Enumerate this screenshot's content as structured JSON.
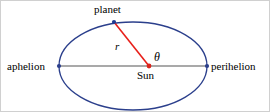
{
  "figure": {
    "labels": {
      "aphelion": "aphelion",
      "perihelion": "perihelion",
      "planet": "planet",
      "sun": "Sun",
      "radius": "r",
      "angle": "θ"
    },
    "colors": {
      "orbit_ellipse": "#2b3f8c",
      "major_axis": "#8c8c8c",
      "radius_line": "#e8201a",
      "sun_marker": "#d9251d",
      "planet_marker": "#1f3a93",
      "vertex_marker": "#2b3f8c",
      "label_text": "#000000",
      "background": "#ffffff",
      "frame_border": "#d0d0d0"
    },
    "geometry": {
      "ellipse_center_x": 132,
      "ellipse_center_y": 65,
      "semi_major_axis": 74,
      "semi_minor_axis": 44,
      "sun_focus_x": 148,
      "sun_focus_y": 65,
      "planet_x": 113,
      "planet_y": 21,
      "aphelion_vertex_x": 58,
      "aphelion_vertex_y": 65,
      "perihelion_vertex_x": 206,
      "perihelion_vertex_y": 65
    }
  }
}
